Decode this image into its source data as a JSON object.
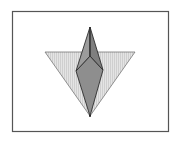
{
  "diagram": {
    "type": "geometric-figure",
    "frame": {
      "x": 12,
      "y": 11,
      "width": 157,
      "height": 121,
      "stroke": "#555555"
    },
    "colors": {
      "background": "#ffffff",
      "triangle_fill": "#e2e2e2",
      "hatch": "#cfcfcf",
      "kite_fill": "#8e8e8e",
      "upper_left_face": "#9c9c9c",
      "upper_right_face": "#7f7f7f",
      "outline": "#2e2e2e"
    },
    "points": {
      "triangle_left": [
        45,
        52
      ],
      "triangle_right": [
        135,
        52
      ],
      "bottom_apex": [
        90,
        116
      ],
      "top_apex": [
        90,
        27
      ],
      "inner_vertex": [
        90,
        56
      ],
      "kite_left": [
        76,
        71
      ],
      "kite_right": [
        103,
        70
      ]
    }
  }
}
